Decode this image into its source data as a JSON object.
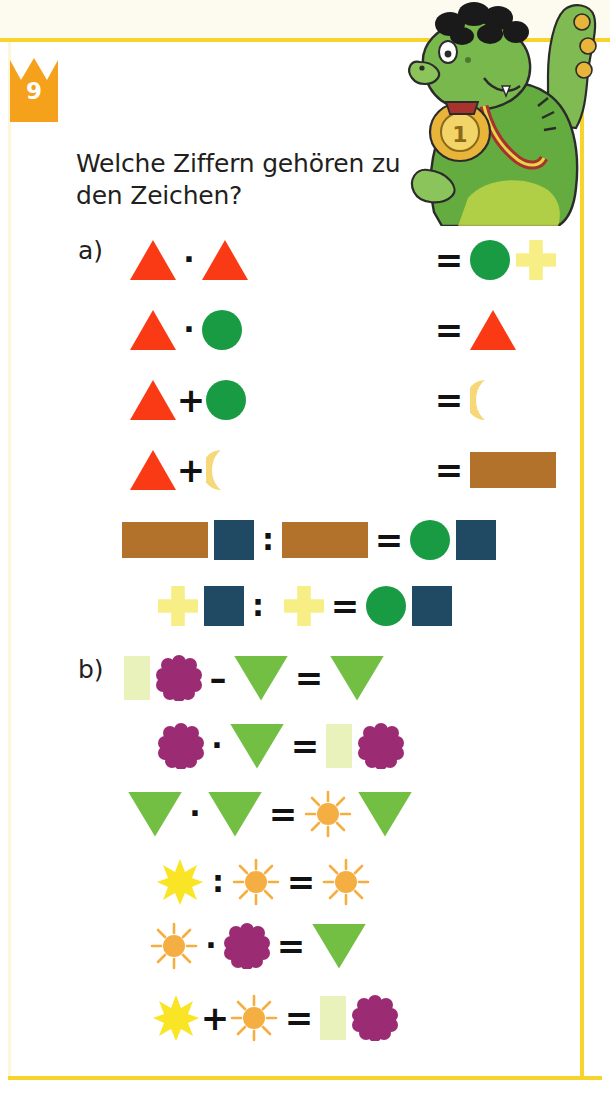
{
  "page": {
    "exercise_number": "9",
    "heading": "Welche Ziffern gehören zu den Zeichen?",
    "frame_color": "#f6d32d",
    "badge_color": "#f5a11b"
  },
  "mascot": {
    "name": "green-dinosaur-with-gold-medal",
    "medal_number": "1",
    "body_color": "#5aa03c",
    "hair_color": "#1a1a1a",
    "medal_color": "#e8b53a"
  },
  "symbol_colors": {
    "triangle_up_red": "#fa3a15",
    "triangle_down_green": "#72bf44",
    "circle_green": "#199b44",
    "cross_yellow": "#f7ef85",
    "moon_yellow": "#f6d878",
    "rect_brown": "#b2722c",
    "square_blue": "#204a63",
    "rect_pale": "#eaf2bb",
    "flower_purple": "#9b2b72",
    "sun_orange": "#f5ae41",
    "star_yellow": "#f9e526"
  },
  "parts": [
    {
      "label": "a)",
      "rows": [
        {
          "left": [
            "triangle-up-red",
            "dot",
            "triangle-up-red"
          ],
          "right": [
            "circle-green",
            "cross-yellow"
          ]
        },
        {
          "left": [
            "triangle-up-red",
            "dot",
            "circle-green"
          ],
          "right": [
            "triangle-up-red"
          ]
        },
        {
          "left": [
            "triangle-up-red",
            "plus",
            "circle-green"
          ],
          "right": [
            "moon-yellow"
          ]
        },
        {
          "left": [
            "triangle-up-red",
            "plus",
            "moon-yellow"
          ],
          "right": [
            "rect-brown"
          ]
        },
        {
          "left": [
            "rect-brown",
            "square-blue",
            "colon",
            "rect-brown"
          ],
          "right": [
            "circle-green",
            "square-blue"
          ]
        },
        {
          "left": [
            "cross-yellow",
            "square-blue",
            "colon",
            "cross-yellow"
          ],
          "right": [
            "circle-green",
            "square-blue"
          ]
        }
      ]
    },
    {
      "label": "b)",
      "rows": [
        {
          "left": [
            "rect-pale",
            "flower-purple",
            "minus",
            "triangle-down-green"
          ],
          "right": [
            "triangle-down-green"
          ]
        },
        {
          "left": [
            "flower-purple",
            "dot",
            "triangle-down-green"
          ],
          "right": [
            "rect-pale",
            "flower-purple"
          ]
        },
        {
          "left": [
            "triangle-down-green",
            "dot",
            "triangle-down-green"
          ],
          "right": [
            "sun-orange",
            "triangle-down-green"
          ]
        },
        {
          "left": [
            "star-yellow",
            "colon",
            "sun-orange"
          ],
          "right": [
            "sun-orange"
          ]
        },
        {
          "left": [
            "sun-orange",
            "dot",
            "flower-purple"
          ],
          "right": [
            "triangle-down-green"
          ]
        },
        {
          "left": [
            "star-yellow",
            "plus",
            "sun-orange"
          ],
          "right": [
            "rect-pale",
            "flower-purple"
          ]
        }
      ]
    }
  ],
  "operators": {
    "dot": "·",
    "plus": "+",
    "minus": "–",
    "colon": ":",
    "equals": "="
  }
}
